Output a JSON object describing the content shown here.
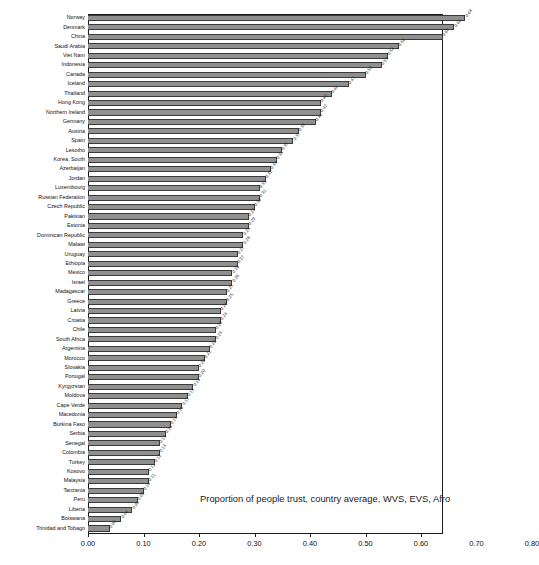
{
  "chart_data": {
    "type": "bar",
    "orientation": "horizontal",
    "title": "",
    "annotation": "Proportion of people trust, country average, WVS, EVS, Afro",
    "xlabel": "",
    "ylabel": "",
    "xlim": [
      0.0,
      0.8
    ],
    "xticks": [
      "0.00",
      "0.10",
      "0.20",
      "0.30",
      "0.40",
      "0.50",
      "0.60",
      "0.70",
      "0.80"
    ],
    "xtick_values": [
      0.0,
      0.1,
      0.2,
      0.3,
      0.4,
      0.5,
      0.6,
      0.7,
      0.8
    ],
    "grid": false,
    "legend": null,
    "bar_color": "#8f8f8f",
    "bar_edge_color": "#3a3a3a",
    "categories": [
      "Norway",
      "Denmark",
      "China",
      "Saudi Arabia",
      "Viet Nam",
      "Indonesia",
      "Canada",
      "Iceland",
      "Thailand",
      "Hong Kong",
      "Northern Ireland",
      "Germany",
      "Austria",
      "Spain",
      "Lesotho",
      "Korea, South",
      "Azerbaijan",
      "Jordan",
      "Luxembourg",
      "Russian Federation",
      "Czech Republic",
      "Pakistan",
      "Estonia",
      "Dominican Republic",
      "Malawi",
      "Uruguay",
      "Ethiopia",
      "Mexico",
      "Israel",
      "Madagascar",
      "Greece",
      "Latvia",
      "Croatia",
      "Chile",
      "South Africa",
      "Argentina",
      "Morocco",
      "Slovakia",
      "Portugal",
      "Kyrgyzstan",
      "Moldova",
      "Cape Verde",
      "Macedonia",
      "Burkina Faso",
      "Serbia",
      "Senegal",
      "Colombia",
      "Turkey",
      "Kosovo",
      "Malaysia",
      "Tanzania",
      "Peru",
      "Liberia",
      "Botswana",
      "Trinidad and Tobago"
    ],
    "values": [
      0.68,
      0.66,
      0.64,
      0.56,
      0.54,
      0.53,
      0.5,
      0.47,
      0.44,
      0.42,
      0.42,
      0.41,
      0.38,
      0.37,
      0.35,
      0.34,
      0.33,
      0.32,
      0.31,
      0.31,
      0.3,
      0.29,
      0.29,
      0.28,
      0.28,
      0.27,
      0.27,
      0.26,
      0.26,
      0.25,
      0.25,
      0.24,
      0.24,
      0.23,
      0.23,
      0.22,
      0.21,
      0.2,
      0.2,
      0.19,
      0.18,
      0.17,
      0.16,
      0.15,
      0.14,
      0.13,
      0.13,
      0.12,
      0.11,
      0.11,
      0.1,
      0.09,
      0.08,
      0.06,
      0.04
    ],
    "value_labels": [
      "0.68",
      "0.66",
      "0.64",
      "0.56",
      "0.54",
      "0.53",
      "0.50",
      "0.47",
      "0.44",
      "0.42",
      "0.42",
      "0.41",
      "0.38",
      "0.37",
      "0.35",
      "0.34",
      "0.33",
      "0.32",
      "0.31",
      "0.31",
      "0.30",
      "0.29",
      "0.29",
      "0.28",
      "0.28",
      "0.27",
      "0.27",
      "0.26",
      "0.26",
      "0.25",
      "0.25",
      "0.24",
      "0.24",
      "0.23",
      "0.23",
      "0.22",
      "0.21",
      "0.20",
      "0.20",
      "0.19",
      "0.18",
      "0.17",
      "0.16",
      "0.15",
      "0.14",
      "0.13",
      "0.13",
      "0.12",
      "0.11",
      "0.11",
      "0.10",
      "0.09",
      "0.08",
      "0.06",
      "0.04"
    ]
  }
}
